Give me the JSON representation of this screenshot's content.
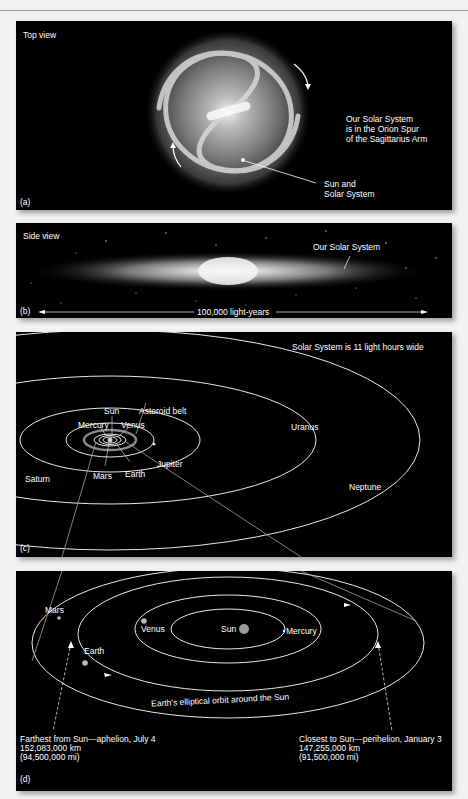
{
  "figure": {
    "panels": [
      {
        "id": "a",
        "tag": "(a)",
        "title": "Top view",
        "note": "Our Solar System\nis in the Orion Spur\nof the Sagittarius Arm",
        "pointer_label": "Sun and\nSolar System"
      },
      {
        "id": "b",
        "tag": "(b)",
        "title": "Side view",
        "pointer_label": "Our Solar System",
        "scale_label": "100,000 light-years"
      },
      {
        "id": "c",
        "tag": "(c)",
        "title": "Solar System is 11 light hours wide",
        "labels": {
          "sun": "Sun",
          "asteroid_belt": "Asteroid belt",
          "mercury": "Mercury",
          "venus": "Venus",
          "jupiter": "Jupiter",
          "mars": "Mars",
          "earth": "Earth",
          "saturn": "Saturn",
          "uranus": "Uranus",
          "neptune": "Neptune"
        }
      },
      {
        "id": "d",
        "tag": "(d)",
        "labels": {
          "mars": "Mars",
          "venus": "Venus",
          "sun": "Sun",
          "mercury": "Mercury",
          "earth": "Earth",
          "orbit_caption": "Earth's elliptical orbit around the Sun"
        },
        "aphelion": {
          "title": "Farthest from Sun—aphelion, July 4",
          "km": "152,083,000 km",
          "mi": "(94,500,000 mi)"
        },
        "perihelion": {
          "title": "Closest to Sun—perihelion, January 3",
          "km": "147,255,000 km",
          "mi": "(91,500,000 mi)"
        }
      }
    ],
    "colors": {
      "panel_bg": "#000000",
      "page_bg": "#f2f2f2",
      "orbit": "#e8e8e8",
      "text": "#ffffff",
      "connector": "#a0a0a0",
      "sun": "#9a9a9a"
    }
  }
}
